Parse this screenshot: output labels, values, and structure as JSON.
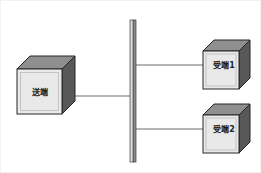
{
  "diagram": {
    "title": "",
    "background_color": "#ffffff",
    "frame_color": "#f2f2f2",
    "nodes": [
      {
        "id": "sender",
        "label": "送端",
        "shape": "cube-3d",
        "front_color": "#e8e8e8",
        "top_color": "#8a8a8a",
        "side_color": "#5a5a5a",
        "outline_color": "#2b2b2b",
        "x": 16,
        "y": 68,
        "width": 45,
        "height": 45,
        "depth": 13
      },
      {
        "id": "receiver-1",
        "label": "受端1",
        "shape": "cube-3d",
        "front_color": "#e8e8e8",
        "top_color": "#8a8a8a",
        "side_color": "#5a5a5a",
        "outline_color": "#2b2b2b",
        "x": 200,
        "y": 50,
        "width": 38,
        "height": 38,
        "depth": 11
      },
      {
        "id": "receiver-2",
        "label": "受端2",
        "shape": "cube-3d",
        "front_color": "#e8e8e8",
        "top_color": "#8a8a8a",
        "side_color": "#5a5a5a",
        "outline_color": "#2b2b2b",
        "x": 200,
        "y": 114,
        "width": 38,
        "height": 38,
        "depth": 11
      }
    ],
    "bus_bar": {
      "id": "bus-bar",
      "label": "",
      "front_color": "#d9d9d9",
      "side_color": "#7a7a7a",
      "outline_color": "#3a3a3a",
      "x": 129,
      "y": 19,
      "width": 6,
      "height": 142
    },
    "connections": [
      {
        "id": "sender-to-bus",
        "from": "sender",
        "to": "bus-bar",
        "x1": 61,
        "y1": 95,
        "x2": 129,
        "y2": 95,
        "color": "#6e6e6e",
        "stroke_width": 1
      },
      {
        "id": "bus-to-receiver-1",
        "from": "bus-bar",
        "to": "receiver-1",
        "x1": 135,
        "y1": 64,
        "x2": 200,
        "y2": 64,
        "color": "#6e6e6e",
        "stroke_width": 1
      },
      {
        "id": "bus-to-receiver-2",
        "from": "bus-bar",
        "to": "receiver-2",
        "x1": 135,
        "y1": 128,
        "x2": 200,
        "y2": 128,
        "color": "#6e6e6e",
        "stroke_width": 1
      }
    ]
  }
}
